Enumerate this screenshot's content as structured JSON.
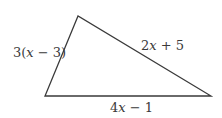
{
  "figure": {
    "type": "triangle",
    "vertices": {
      "top": [
        78,
        16
      ],
      "bottom_left": [
        45,
        96
      ],
      "bottom_right": [
        211,
        96
      ]
    },
    "stroke_color": "#3a3a3a",
    "sides": [
      {
        "id": "left",
        "label": "3(x − 3)",
        "parts": [
          "3(",
          "x",
          " − 3)"
        ]
      },
      {
        "id": "right",
        "label": "2x + 5",
        "parts": [
          "2",
          "x",
          " + 5"
        ]
      },
      {
        "id": "bottom",
        "label": "4x − 1",
        "parts": [
          "4",
          "x",
          " − 1"
        ]
      }
    ]
  }
}
